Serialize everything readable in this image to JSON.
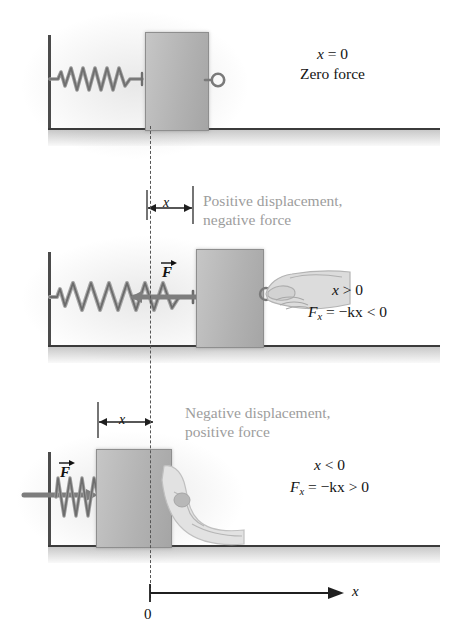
{
  "figure": {
    "colors": {
      "block_fill": "#bdbdbd",
      "block_edge": "#8e8e8e",
      "caption_gray": "#9d9d9d",
      "ink": "#141414",
      "wall": "#4b4b4b",
      "ground": "#3b3b3b",
      "spring": "#8c8c8c",
      "hand": "#d8d8d8"
    }
  },
  "panels": [
    {
      "id": "equilibrium",
      "caption": "",
      "equations": [
        "x = 0",
        "Zero force"
      ],
      "state_label_x": "x = 0",
      "state_label_force": "Zero force",
      "spring_state": "relaxed",
      "spring_coils": 5,
      "force_label": "",
      "hand_present": false,
      "hook_present": true,
      "dimension_label": ""
    },
    {
      "id": "stretched",
      "caption_line1": "Positive displacement,",
      "caption_line2": "negative force",
      "eq_line1_prefix": "x",
      "eq_line1_rest": " > 0",
      "eq_line2_F": "F",
      "eq_line2_sub": "x",
      "eq_line2_rest": " = −kx < 0",
      "spring_state": "stretched",
      "spring_coils": 5,
      "force_label": "F",
      "force_direction": "left",
      "hand_present": true,
      "hook_present": true,
      "dimension_label": "x"
    },
    {
      "id": "compressed",
      "caption_line1": "Negative displacement,",
      "caption_line2": "positive force",
      "eq_line1_prefix": "x",
      "eq_line1_rest": " < 0",
      "eq_line2_F": "F",
      "eq_line2_sub": "x",
      "eq_line2_rest": " = −kx > 0",
      "spring_state": "compressed",
      "spring_coils": 7,
      "force_label": "F",
      "force_direction": "right",
      "hand_present": true,
      "hook_present": false,
      "dimension_label": "x"
    }
  ],
  "axis": {
    "label": "x",
    "origin_label": "0",
    "direction": "right"
  },
  "icons": {
    "spring": "spring-coil-icon",
    "hand": "hand-pulling-icon",
    "hook": "hook-loop-icon",
    "force_arrow": "force-vector-arrow-icon",
    "dimension_arrow": "dimension-double-arrow-icon",
    "axis_arrow": "axis-arrow-icon"
  }
}
